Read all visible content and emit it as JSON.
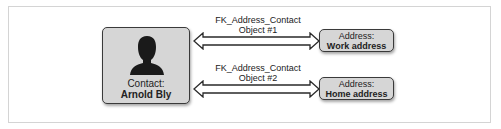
{
  "diagram": {
    "contact": {
      "label": "Contact:",
      "name": "Arnold Bly",
      "icon": "person-silhouette-icon"
    },
    "relationships": [
      {
        "name": "FK_Address_Contact",
        "object": "Object #1"
      },
      {
        "name": "FK_Address_Contact",
        "object": "Object #2"
      }
    ],
    "addresses": [
      {
        "label": "Address:",
        "value": "Work address"
      },
      {
        "label": "Address:",
        "value": "Home address"
      }
    ],
    "colors": {
      "box_fill": "#d6d6d6",
      "box_border": "#3a3a3a",
      "silhouette": "#1a1a1a",
      "frame": "#d4d4d4"
    }
  }
}
